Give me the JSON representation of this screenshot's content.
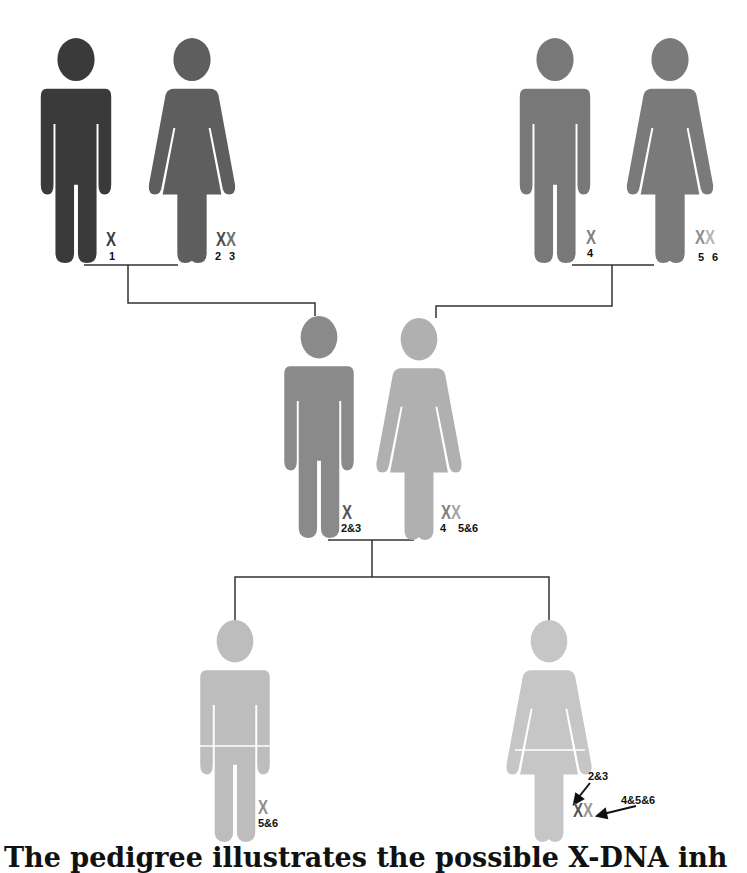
{
  "figure": {
    "caption": "The pedigree illustrates the possible X-DNA inh"
  },
  "colors": {
    "line": "#333333",
    "paternal_grandfather": "#3a3a3a",
    "paternal_grandmother": "#5e5e5e",
    "maternal_grandfather": "#787878",
    "maternal_grandmother": "#7a7a7a",
    "father": "#8a8a8a",
    "mother": "#b0b0b0",
    "son": "#bdbdbd",
    "daughter": "#c6c6c6",
    "x_1": "#3d3d3d",
    "x_2": "#4a4a4a",
    "x_3": "#707070",
    "x_4": "#808080",
    "x_5": "#8d8d8d",
    "x_6": "#b5b5b5",
    "x_23": "#555555",
    "x_456": "#999999"
  },
  "generations": [
    {
      "name": "grandparents",
      "couples": [
        {
          "side": "paternal",
          "male": {
            "role": "grandfather",
            "x_chromosomes": [
              "X"
            ],
            "labels": [
              "1"
            ]
          },
          "female": {
            "role": "grandmother",
            "x_chromosomes": [
              "X",
              "X"
            ],
            "labels": [
              "2",
              "3"
            ]
          }
        },
        {
          "side": "maternal",
          "male": {
            "role": "grandfather",
            "x_chromosomes": [
              "X"
            ],
            "labels": [
              "4"
            ]
          },
          "female": {
            "role": "grandmother",
            "x_chromosomes": [
              "X",
              "X"
            ],
            "labels": [
              "5",
              "6"
            ]
          }
        }
      ]
    },
    {
      "name": "parents",
      "male": {
        "role": "father",
        "x_chromosomes": [
          "X"
        ],
        "labels": [
          "2&3"
        ]
      },
      "female": {
        "role": "mother",
        "x_chromosomes": [
          "X",
          "X"
        ],
        "labels": [
          "4",
          "5&6"
        ]
      }
    },
    {
      "name": "children",
      "son": {
        "role": "son",
        "x_chromosomes": [
          "X"
        ],
        "labels": [
          "5&6"
        ]
      },
      "daughter": {
        "role": "daughter",
        "x_chromosomes": [
          "X",
          "X"
        ],
        "annotations": [
          "2&3",
          "4&5&6"
        ]
      }
    }
  ]
}
